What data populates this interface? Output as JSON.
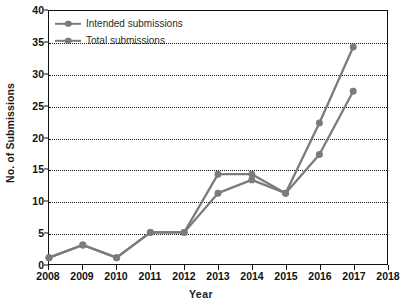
{
  "chart_data": {
    "type": "line",
    "title": "",
    "xlabel": "Year",
    "ylabel": "No. of Submissions",
    "xlim": [
      2008,
      2018
    ],
    "ylim": [
      0,
      40
    ],
    "xticks": [
      2008,
      2009,
      2010,
      2011,
      2012,
      2013,
      2014,
      2015,
      2016,
      2017,
      2018
    ],
    "xtick_labels": [
      "2008",
      "2009",
      "2010",
      "2011",
      "2012",
      "2013",
      "2014",
      "2015",
      "2016",
      "2017",
      "2018"
    ],
    "yticks": [
      0,
      5,
      10,
      15,
      20,
      25,
      30,
      35,
      40
    ],
    "ytick_labels": [
      "0",
      "5",
      "10",
      "15",
      "20",
      "25",
      "30",
      "35",
      "40"
    ],
    "grid": "horizontal-dotted",
    "legend_position": "top-left",
    "x": [
      2008,
      2009,
      2010,
      2011,
      2012,
      2013,
      2014,
      2015,
      2016,
      2017
    ],
    "series": [
      {
        "name": "Intended submissions",
        "color": "#7b7b7b",
        "marker": "circle",
        "values": [
          1,
          3,
          1,
          5,
          5,
          11.2,
          13.3,
          11.2,
          17.3,
          27.3
        ]
      },
      {
        "name": "Total submissions",
        "color": "#7b7b7b",
        "marker": "circle",
        "values": [
          1,
          3,
          1,
          5,
          5,
          14.2,
          14.2,
          11.2,
          22.3,
          34.3
        ]
      }
    ]
  },
  "legend": {
    "items": [
      {
        "label": "Intended submissions"
      },
      {
        "label": "Total submissions"
      }
    ]
  },
  "axes": {
    "x_title": "Year",
    "y_title": "No. of Submissions"
  },
  "colors": {
    "line": "#7b7b7b",
    "axis": "#111111",
    "background": "#ffffff",
    "grid": "#111111"
  }
}
